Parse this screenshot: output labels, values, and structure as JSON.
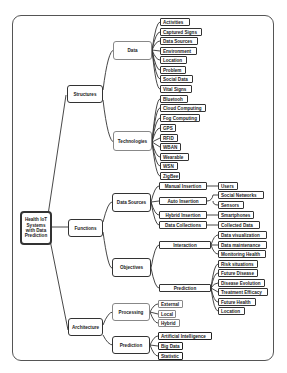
{
  "diagram": {
    "type": "mind-map",
    "root": "Health IoT Systems with Data Prediction",
    "branches": {
      "structures": {
        "label": "Structures",
        "data": {
          "label": "Data",
          "items": [
            "Activities",
            "Captured Signs",
            "Data Sources",
            "Environment",
            "Location",
            "Problem",
            "Social Data",
            "Vital Signs"
          ]
        },
        "technologies": {
          "label": "Technologies",
          "items": [
            "Bluetooh",
            "Cloud Computing",
            "Fog Computing",
            "GPS",
            "RFID",
            "WBAN",
            "Wearable",
            "WSN",
            "ZigBee"
          ]
        }
      },
      "functions": {
        "label": "Functions",
        "data_sources": {
          "label": "Data Sources",
          "manual": {
            "label": "Manual Insertion",
            "items": [
              "Users"
            ]
          },
          "auto": {
            "label": "Auto Insertion",
            "items": [
              "Social Networks",
              "Sensors"
            ]
          },
          "hybrid": {
            "label": "Hybrid Insertion",
            "items": [
              "Smartphones"
            ]
          },
          "collections": {
            "label": "Data Collections",
            "items": [
              "Collected Data"
            ]
          }
        },
        "objectives": {
          "label": "Objectives",
          "interaction": {
            "label": "Interaction",
            "items": [
              "Data visualization",
              "Data maintenance",
              "Monitoring Health"
            ]
          },
          "prediction": {
            "label": "Prediction",
            "items": [
              "Risk situations",
              "Future Disease",
              "Disease Evolution",
              "Treatment Efficacy",
              "Future Health",
              "Location"
            ]
          }
        }
      },
      "architecture": {
        "label": "Architecture",
        "processing": {
          "label": "Processing",
          "items": [
            "External",
            "Local",
            "Hybrid"
          ]
        },
        "prediction": {
          "label": "Prediction",
          "items": [
            "Artificial Intelligence",
            "Big Data",
            "Statistic"
          ]
        }
      }
    }
  }
}
